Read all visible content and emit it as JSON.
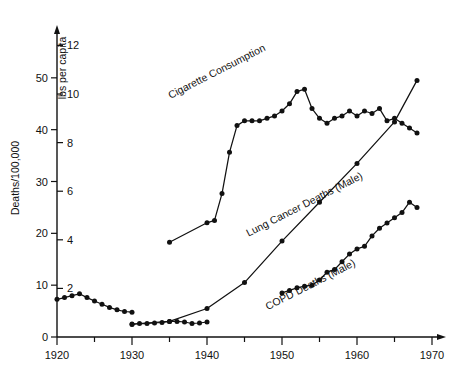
{
  "chart_data": {
    "type": "line",
    "title": "",
    "xlabel": "",
    "xlim": [
      1920,
      1970
    ],
    "xticks": [
      1920,
      1930,
      1940,
      1950,
      1960,
      1970
    ],
    "xminor_step": 5,
    "grid": false,
    "legend_position": "inline-rotated-labels",
    "axes": [
      {
        "id": "left",
        "label": "Deaths/100,000",
        "ticks": [
          0,
          10,
          20,
          30,
          40,
          50
        ],
        "lim": [
          0,
          60
        ]
      },
      {
        "id": "right",
        "label": "lbs per capita",
        "ticks": [
          0,
          2,
          4,
          6,
          8,
          10,
          12
        ],
        "lim": [
          0,
          12.8
        ]
      }
    ],
    "series": [
      {
        "name": "Cigarette Consumption",
        "axis": "right",
        "units": "lbs per capita",
        "label_angle": -27,
        "label_x": 1941.5,
        "label_y": 10.8,
        "x": [
          1935,
          1940,
          1941,
          1942,
          1943,
          1944,
          1945,
          1946,
          1947,
          1948,
          1949,
          1950,
          1951,
          1952,
          1953,
          1954,
          1955,
          1956,
          1957,
          1958,
          1959,
          1960,
          1961,
          1962,
          1963,
          1964,
          1965,
          1966,
          1967,
          1968
        ],
        "values": [
          3.9,
          4.7,
          4.8,
          5.9,
          7.6,
          8.7,
          8.9,
          8.9,
          8.9,
          9.0,
          9.1,
          9.3,
          9.6,
          10.1,
          10.2,
          9.4,
          9.0,
          8.8,
          9.0,
          9.1,
          9.3,
          9.1,
          9.3,
          9.2,
          9.4,
          8.9,
          9.0,
          8.8,
          8.6,
          8.4
        ]
      },
      {
        "name": "Lung Cancer Deaths (Male)",
        "axis": "left",
        "units": "deaths per 100,000",
        "label_angle": -27,
        "label_x": 1953.2,
        "label_y": 25.0,
        "x": [
          1930,
          1935,
          1940,
          1945,
          1950,
          1955,
          1960,
          1965,
          1968
        ],
        "values": [
          2.5,
          3.0,
          5.5,
          10.5,
          18.5,
          26.0,
          33.5,
          41.5,
          49.5
        ]
      },
      {
        "name": "COPD Deaths (Male)",
        "axis": "left",
        "units": "deaths per 100,000",
        "label_angle": -27,
        "label_x": 1954.0,
        "label_y": 9.5,
        "x": [
          1950,
          1951,
          1952,
          1953,
          1954,
          1955,
          1956,
          1957,
          1958,
          1959,
          1960,
          1961,
          1962,
          1963,
          1964,
          1965,
          1966,
          1967,
          1968
        ],
        "values": [
          8.5,
          9.0,
          9.5,
          9.8,
          10.0,
          11.0,
          12.5,
          13.0,
          14.5,
          16.0,
          17.0,
          17.5,
          19.5,
          21.0,
          22.0,
          23.0,
          24.0,
          26.0,
          25.0
        ]
      },
      {
        "name": "Cigarette Consumption (early)",
        "axis": "right",
        "units": "lbs per capita",
        "label_angle": 0,
        "label_x": null,
        "label_y": null,
        "x": [
          1920,
          1921,
          1922,
          1923,
          1924,
          1925,
          1926,
          1927,
          1928,
          1929,
          1930
        ],
        "values": [
          1.55,
          1.62,
          1.7,
          1.78,
          1.62,
          1.48,
          1.35,
          1.22,
          1.12,
          1.05,
          1.02
        ]
      },
      {
        "name": "Lung Cancer Deaths (Male, early)",
        "axis": "left",
        "units": "deaths per 100,000",
        "label_angle": 0,
        "label_x": null,
        "label_y": null,
        "x": [
          1930,
          1931,
          1932,
          1933,
          1934,
          1935,
          1936,
          1937,
          1938,
          1939,
          1940
        ],
        "values": [
          2.4,
          2.6,
          2.6,
          2.7,
          2.8,
          3.0,
          3.0,
          2.9,
          2.6,
          2.7,
          2.9
        ]
      }
    ],
    "annotations": [
      {
        "text": "Cigarette Consumption"
      },
      {
        "text": "Lung Cancer Deaths (Male)"
      },
      {
        "text": "COPD Deaths (Male)"
      }
    ]
  }
}
